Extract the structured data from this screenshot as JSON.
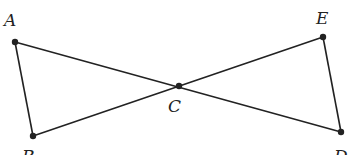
{
  "diagram": {
    "points": [
      {
        "id": "A",
        "label": "A",
        "x": 15,
        "y": 42,
        "lx": 4,
        "ly": 26
      },
      {
        "id": "B",
        "label": "B",
        "x": 33,
        "y": 136,
        "lx": 22,
        "ly": 162
      },
      {
        "id": "C",
        "label": "C",
        "x": 179,
        "y": 86,
        "lx": 168,
        "ly": 112
      },
      {
        "id": "D",
        "label": "D",
        "x": 341,
        "y": 132,
        "lx": 334,
        "ly": 162
      },
      {
        "id": "E",
        "label": "E",
        "x": 323,
        "y": 37,
        "lx": 316,
        "ly": 24
      }
    ],
    "segments": [
      [
        "A",
        "D"
      ],
      [
        "B",
        "E"
      ],
      [
        "A",
        "B"
      ],
      [
        "E",
        "D"
      ]
    ],
    "color": "#222222"
  }
}
